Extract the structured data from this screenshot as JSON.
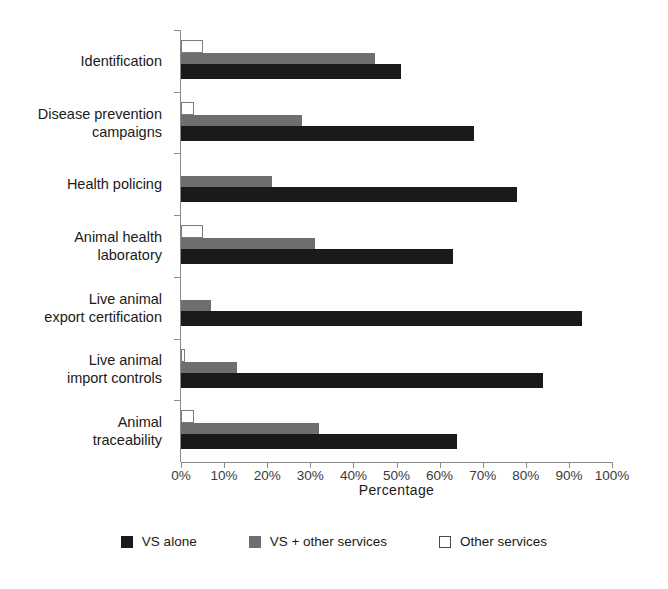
{
  "chart_data": {
    "type": "bar",
    "orientation": "horizontal",
    "grouped": true,
    "title": "",
    "xlabel": "Percentage",
    "ylabel": "",
    "xlim": [
      0,
      100
    ],
    "grid": false,
    "legend_position": "bottom",
    "categories": [
      "Identification",
      "Disease prevention\ncampaigns",
      "Health policing",
      "Animal health\nlaboratory",
      "Live animal\nexport certification",
      "Live animal\nimport controls",
      "Animal\ntraceability"
    ],
    "xtick_labels": [
      "0%",
      "10%",
      "20%",
      "30%",
      "40%",
      "50%",
      "60%",
      "70%",
      "80%",
      "90%",
      "100%"
    ],
    "xticks": [
      0,
      10,
      20,
      30,
      40,
      50,
      60,
      70,
      80,
      90,
      100
    ],
    "series": [
      {
        "name": "VS alone",
        "color": "#1a1a1a",
        "values": [
          51,
          68,
          78,
          63,
          93,
          84,
          64
        ]
      },
      {
        "name": "VS + other services",
        "color": "#6e6e6e",
        "values": [
          45,
          28,
          21,
          31,
          7,
          13,
          32
        ]
      },
      {
        "name": "Other services",
        "color": "#ffffff",
        "values": [
          5,
          3,
          0,
          5,
          0,
          1,
          3
        ]
      }
    ]
  },
  "legend": {
    "items": [
      {
        "label": "VS alone",
        "swatch": "vsalone"
      },
      {
        "label": "VS + other services",
        "swatch": "vsother"
      },
      {
        "label": "Other services",
        "swatch": "other"
      }
    ]
  }
}
